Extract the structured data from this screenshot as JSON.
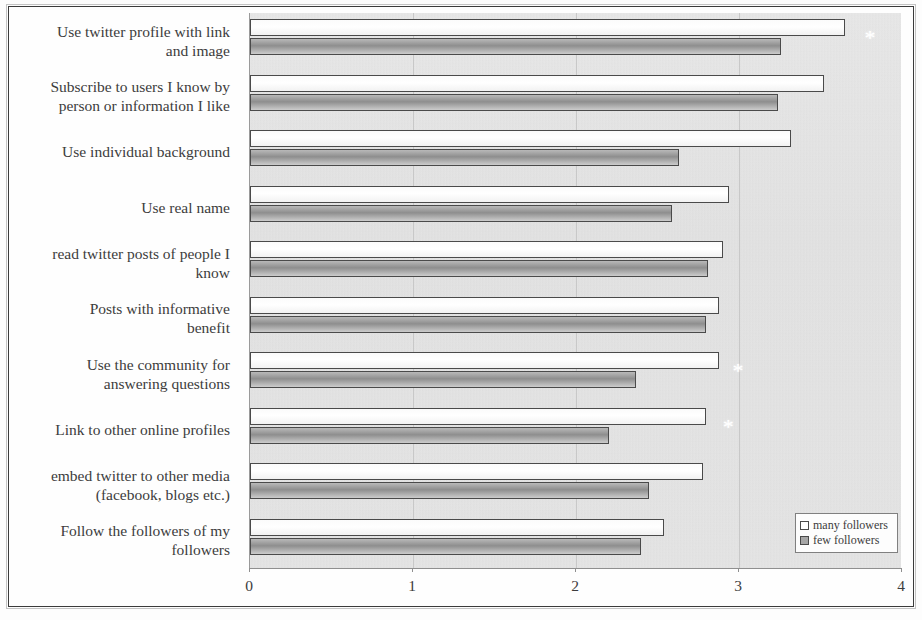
{
  "chart_data": {
    "type": "bar",
    "orientation": "horizontal",
    "title": "",
    "xlabel": "",
    "ylabel": "",
    "xlim": [
      0,
      4
    ],
    "xticks": [
      "0",
      "1",
      "2",
      "3",
      "4"
    ],
    "grid": true,
    "grid_axis": "x",
    "legend_position": "bottom-right",
    "categories": [
      "Use twitter profile with link and image",
      "Subscribe to users I know by person or information I like",
      "Use individual background",
      "Use real name",
      "read twitter posts of people I know",
      "Posts with informative benefit",
      "Use the community for answering questions",
      "Link to other online profiles",
      "embed twitter to other media (facebook, blogs etc.)",
      "Follow the followers of my followers"
    ],
    "category_lines": [
      [
        "Use twitter profile with link",
        "and image"
      ],
      [
        "Subscribe to users I know by",
        "person or information I like"
      ],
      [
        "Use individual background"
      ],
      [
        "Use real name"
      ],
      [
        "read twitter posts of people I",
        "know"
      ],
      [
        "Posts with informative",
        "benefit"
      ],
      [
        "Use the community for",
        "answering questions"
      ],
      [
        "Link to other online profiles"
      ],
      [
        "embed twitter to other media",
        "(facebook, blogs etc.)"
      ],
      [
        "Follow the followers of my",
        "followers"
      ]
    ],
    "series": [
      {
        "name": "many followers",
        "color": "#ffffff",
        "values": [
          3.65,
          3.52,
          3.32,
          2.94,
          2.9,
          2.88,
          2.88,
          2.8,
          2.78,
          2.54
        ]
      },
      {
        "name": "few followers",
        "color": "#a6a6a6",
        "values": [
          3.26,
          3.24,
          2.63,
          2.59,
          2.81,
          2.8,
          2.37,
          2.2,
          2.45,
          2.4
        ]
      }
    ],
    "annotations": [
      {
        "symbol": "*",
        "category_index": 0,
        "x": 3.77
      },
      {
        "symbol": "*",
        "category_index": 6,
        "x": 2.96
      },
      {
        "symbol": "*",
        "category_index": 7,
        "x": 2.9
      }
    ]
  },
  "legend": {
    "items": [
      {
        "label": "many followers",
        "swatch": "many"
      },
      {
        "label": "few followers",
        "swatch": "few"
      }
    ]
  },
  "axis": {
    "ticks": [
      {
        "label": "0",
        "value": 0
      },
      {
        "label": "1",
        "value": 1
      },
      {
        "label": "2",
        "value": 2
      },
      {
        "label": "3",
        "value": 3
      },
      {
        "label": "4",
        "value": 4
      }
    ]
  }
}
